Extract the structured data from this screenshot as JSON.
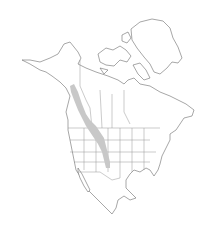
{
  "map": {
    "title": "Range map",
    "region": "North America",
    "colors": {
      "background": "#ffffff",
      "outline": "#6b6b6b",
      "range_fill": "#c8c8c8"
    },
    "range_description": "Shaded band along the Rocky Mountains from northern British Columbia / Yukon south through Alberta, Montana, Wyoming, Colorado to northern New Mexico"
  }
}
